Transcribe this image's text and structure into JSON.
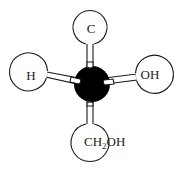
{
  "diagram": {
    "title": "",
    "center_atom": {
      "label": "",
      "color": "#000000"
    },
    "substituents": {
      "top": {
        "label": "C"
      },
      "left": {
        "label": "H"
      },
      "right": {
        "label": "OH"
      },
      "bottom": {
        "label_main": "CH",
        "label_sub": "2",
        "label_tail": "OH",
        "label_full": "CH2OH"
      }
    },
    "colors": {
      "stroke": "#1a1a1a",
      "ball_fill": "#ffffff",
      "center_fill": "#000000",
      "background": "#ffffff"
    }
  }
}
